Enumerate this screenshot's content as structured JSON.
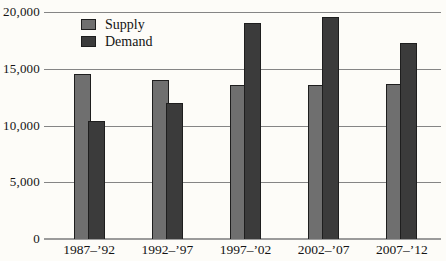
{
  "chart_data": {
    "type": "bar",
    "categories": [
      "1987–’92",
      "1992–’97",
      "1997–’02",
      "2002–’07",
      "2007–’12"
    ],
    "series": [
      {
        "name": "Supply",
        "color": "#6f6f6f",
        "values": [
          14500,
          14000,
          13600,
          13600,
          13700
        ]
      },
      {
        "name": "Demand",
        "color": "#3b3b3b",
        "values": [
          10400,
          12000,
          19000,
          19600,
          17300
        ]
      }
    ],
    "title": "",
    "xlabel": "",
    "ylabel": "",
    "ylim": [
      0,
      20000
    ],
    "yticks": [
      0,
      5000,
      10000,
      15000,
      20000
    ],
    "ytick_labels": [
      "0",
      "5,000",
      "10,000",
      "15,000",
      "20,000"
    ],
    "grid": "horizontal",
    "legend_position": "top-left"
  },
  "legend": {
    "items": [
      {
        "label": "Supply",
        "color": "#6f6f6f"
      },
      {
        "label": "Demand",
        "color": "#3b3b3b"
      }
    ]
  },
  "colors": {
    "background": "#fdfcf8",
    "gridline": "#858585",
    "axis_line": "#9b9b9b",
    "bar_border": "#1e1e1e",
    "text": "#141414"
  }
}
